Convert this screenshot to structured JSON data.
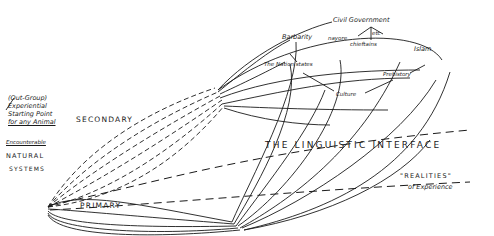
{
  "diagram": {
    "type": "hand-drawn concept diagram",
    "left_labels": {
      "out_group": "(Out-Group)",
      "experiential": "Experiential",
      "starting_point": "Starting Point",
      "for_any_animal": "for any Animal",
      "encounterable": "Encounterable",
      "natural": "NATURAL",
      "systems": "SYSTEMS"
    },
    "path_labels": {
      "secondary": "SECONDARY",
      "primary": "PRIMARY"
    },
    "concept_labels": {
      "civil_government": "Civil Government",
      "nayore": "nayore",
      "chieftains": "chieftains",
      "etc": "etc",
      "barbarity": "Barbarity",
      "nation_states": "The Nation states",
      "islam": "Islam",
      "prehistory": "Prehistory",
      "culture": "Culture"
    },
    "interface": {
      "label": "THE  LINGUISTIC  INTERFACE"
    },
    "realities": {
      "line1": "\"REALITIES\"",
      "line2": "of Experience"
    },
    "colors": {
      "ink": "#1a1a1a",
      "paper": "#ffffff"
    }
  }
}
